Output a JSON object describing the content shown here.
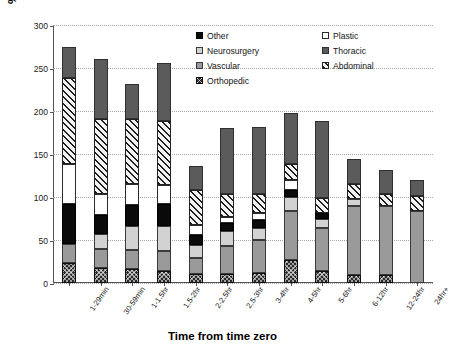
{
  "chart_data": {
    "type": "bar",
    "stacked": true,
    "title": "",
    "xlabel": "Time from time zero",
    "ylabel": "% of operations beginning",
    "ylim": [
      0,
      300
    ],
    "yticks": [
      0,
      50,
      100,
      150,
      200,
      250,
      300
    ],
    "grid": true,
    "legend_position": "top-right",
    "categories": [
      "1-29min",
      "30-59min",
      "1-1.5hr",
      "1.5-2hr",
      "2-2.5hr",
      "2.5-3hr",
      "3-4hr",
      "4-5hr",
      "5-6hr",
      "6-12hr",
      "12-24hr",
      "24hr+"
    ],
    "series": [
      {
        "name": "Orthopedic",
        "values": [
          23,
          18,
          16,
          14,
          11,
          11,
          12,
          27,
          14,
          9,
          9,
          0
        ]
      },
      {
        "name": "Vascular",
        "values": [
          22,
          21,
          22,
          23,
          18,
          32,
          38,
          57,
          50,
          81,
          81,
          84
        ]
      },
      {
        "name": "Neurosurgery",
        "values": [
          0,
          18,
          28,
          29,
          15,
          18,
          14,
          16,
          10,
          8,
          0,
          0
        ]
      },
      {
        "name": "Other",
        "values": [
          47,
          22,
          25,
          26,
          12,
          9,
          9,
          8,
          8,
          0,
          0,
          0
        ]
      },
      {
        "name": "Plastic",
        "values": [
          47,
          24,
          24,
          22,
          12,
          7,
          8,
          12,
          0,
          0,
          0,
          0
        ]
      },
      {
        "name": "Abdominal",
        "values": [
          99,
          88,
          76,
          74,
          40,
          26,
          23,
          19,
          17,
          17,
          14,
          17
        ]
      },
      {
        "name": "Thoracic",
        "values": [
          37,
          70,
          41,
          68,
          28,
          77,
          77,
          59,
          89,
          29,
          27,
          19
        ]
      }
    ],
    "totals": [
      275,
      261,
      232,
      256,
      136,
      180,
      181,
      198,
      188,
      144,
      131,
      120
    ],
    "annotations": []
  },
  "legend": {
    "items": [
      {
        "label": "Other",
        "swatch": "solid-black"
      },
      {
        "label": "Plastic",
        "swatch": "white"
      },
      {
        "label": "Neurosurgery",
        "swatch": "light-gray"
      },
      {
        "label": "Thoracic",
        "swatch": "dark-gray"
      },
      {
        "label": "Vascular",
        "swatch": "medium-gray"
      },
      {
        "label": "Abdominal",
        "swatch": "diagonal-hatch"
      },
      {
        "label": "Orthopedic",
        "swatch": "checker-dark"
      }
    ]
  },
  "colors": {
    "orthopedic": "#2a2a2a",
    "vascular": "#9a9a9a",
    "neurosurgery": "#d2d2d2",
    "other": "#0a0a0a",
    "plastic": "#ffffff",
    "abdominal": "#f2f2f2",
    "thoracic": "#5b5b5b",
    "axis": "#555555",
    "grid": "#a8a8a8"
  }
}
